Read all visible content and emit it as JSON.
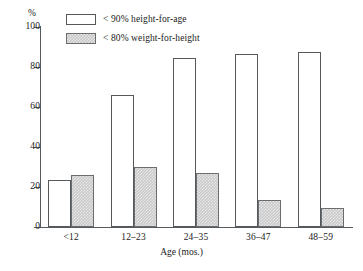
{
  "chart_data": {
    "type": "bar",
    "title": "",
    "subtitle": "",
    "xlabel": "Age (mos.)",
    "ylabel": "%",
    "ylim": [
      0,
      100
    ],
    "yticks": [
      0,
      20,
      40,
      60,
      80,
      100
    ],
    "ytick_labels": [
      "0",
      "20",
      "40",
      "60",
      "80",
      "100"
    ],
    "grid": false,
    "legend_position": "top-left-inside",
    "categories": [
      "<12",
      "12–23",
      "24–35",
      "36–47",
      "48–59"
    ],
    "series": [
      {
        "name": "< 90% height-for-age",
        "style": "open",
        "color": "#ffffff",
        "edge_color": "#55595c",
        "values": [
          23.5,
          66,
          84.5,
          86.5,
          87.5
        ]
      },
      {
        "name": "< 80% weight-for-height",
        "style": "hatched-gray",
        "color": "#c9c9c9",
        "edge_color": "#6a6d70",
        "values": [
          26,
          30,
          27,
          13.5,
          9.5
        ]
      }
    ]
  },
  "axes": {
    "y_unit_label": "%",
    "x_axis_title": "Age (mos.)"
  },
  "legend": {
    "items": [
      {
        "label": "< 90% height-for-age",
        "swatch": "open-box-swatch"
      },
      {
        "label": "< 80% weight-for-height",
        "swatch": "filled-box-swatch"
      }
    ]
  }
}
